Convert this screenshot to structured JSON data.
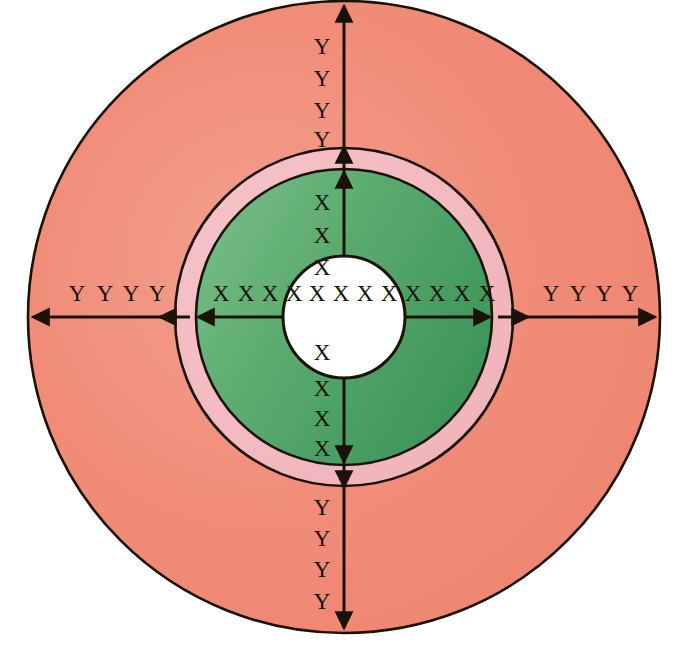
{
  "figure": {
    "center_x": 344,
    "center_y": 317,
    "background_color": "#ffffff",
    "outline_color": "#1a1208"
  },
  "zones": [
    {
      "id": "outer-zone",
      "name": "outer-salmon-zone",
      "radius": 316,
      "color": "#F08A76",
      "color_light": "#F4A28F",
      "label_symbol": "Y"
    },
    {
      "id": "middle-zone",
      "name": "middle-pink-ring",
      "radius": 169,
      "color": "#F2B8BE",
      "color_light": "#F6C8CC",
      "label_symbol": ""
    },
    {
      "id": "inner-zone",
      "name": "inner-green-zone",
      "radius": 148,
      "color": "#4FA163",
      "color_light": "#74BD85",
      "label_symbol": "X"
    },
    {
      "id": "core-zone",
      "name": "white-core",
      "radius": 61,
      "color": "#ffffff",
      "color_light": "#ffffff",
      "label_symbol": "X"
    }
  ],
  "axes": {
    "vertical_up": {
      "name": "vertical-up-axis",
      "outer_labels": [
        "Y",
        "Y",
        "Y",
        "Y"
      ],
      "inner_labels": [
        "X",
        "X",
        "X"
      ]
    },
    "vertical_down": {
      "name": "vertical-down-axis",
      "outer_labels": [
        "Y",
        "Y",
        "Y",
        "Y"
      ],
      "inner_labels": [
        "X",
        "X",
        "X",
        "X"
      ]
    },
    "horizontal_left": {
      "name": "horizontal-left-axis",
      "outer_labels": [
        "Y",
        "Y",
        "Y",
        "Y"
      ],
      "inner_labels": [
        "X",
        "X",
        "X",
        "X"
      ]
    },
    "horizontal_right": {
      "name": "horizontal-right-axis",
      "outer_labels": [
        "Y",
        "Y",
        "Y",
        "Y"
      ],
      "inner_labels": [
        "X",
        "X",
        "X"
      ]
    },
    "core_row": {
      "name": "core-horizontal-labels",
      "labels": [
        "X",
        "X",
        "X",
        "X",
        "X"
      ]
    }
  },
  "label_positions": {
    "vertical_up_outer": [
      {
        "text": "Y",
        "x": 322,
        "y": 49
      },
      {
        "text": "Y",
        "x": 322,
        "y": 81
      },
      {
        "text": "Y",
        "x": 322,
        "y": 113
      },
      {
        "text": "Y",
        "x": 322,
        "y": 142
      }
    ],
    "vertical_up_inner": [
      {
        "text": "X",
        "x": 322,
        "y": 205
      },
      {
        "text": "X",
        "x": 322,
        "y": 238
      },
      {
        "text": "X",
        "x": 322,
        "y": 270
      }
    ],
    "vertical_down_inner": [
      {
        "text": "X",
        "x": 322,
        "y": 355
      },
      {
        "text": "X",
        "x": 322,
        "y": 391
      },
      {
        "text": "X",
        "x": 322,
        "y": 421
      },
      {
        "text": "X",
        "x": 322,
        "y": 451
      }
    ],
    "vertical_down_outer": [
      {
        "text": "Y",
        "x": 322,
        "y": 510
      },
      {
        "text": "Y",
        "x": 322,
        "y": 541
      },
      {
        "text": "Y",
        "x": 322,
        "y": 572
      },
      {
        "text": "Y",
        "x": 322,
        "y": 604
      }
    ],
    "horizontal_left_outer": [
      {
        "text": "Y",
        "x": 77,
        "y": 296
      },
      {
        "text": "Y",
        "x": 105,
        "y": 296
      },
      {
        "text": "Y",
        "x": 131,
        "y": 296
      },
      {
        "text": "Y",
        "x": 157,
        "y": 296
      }
    ],
    "horizontal_left_inner": [
      {
        "text": "X",
        "x": 221,
        "y": 296
      },
      {
        "text": "X",
        "x": 246,
        "y": 296
      },
      {
        "text": "X",
        "x": 270,
        "y": 296
      },
      {
        "text": "X",
        "x": 294,
        "y": 296
      }
    ],
    "core_row": [
      {
        "text": "X",
        "x": 317,
        "y": 296
      },
      {
        "text": "X",
        "x": 341,
        "y": 296
      },
      {
        "text": "X",
        "x": 365,
        "y": 296
      },
      {
        "text": "X",
        "x": 389,
        "y": 296
      },
      {
        "text": "X",
        "x": 413,
        "y": 296
      }
    ],
    "horizontal_right_inner": [
      {
        "text": "X",
        "x": 437,
        "y": 296
      },
      {
        "text": "X",
        "x": 462,
        "y": 296
      },
      {
        "text": "X",
        "x": 487,
        "y": 296
      }
    ],
    "horizontal_right_outer": [
      {
        "text": "Y",
        "x": 551,
        "y": 296
      },
      {
        "text": "Y",
        "x": 578,
        "y": 296
      },
      {
        "text": "Y",
        "x": 604,
        "y": 296
      },
      {
        "text": "Y",
        "x": 630,
        "y": 296
      }
    ]
  },
  "arrows": {
    "name": "radial-dimension-arrows",
    "color": "#1a1208",
    "stroke_width": 3
  }
}
